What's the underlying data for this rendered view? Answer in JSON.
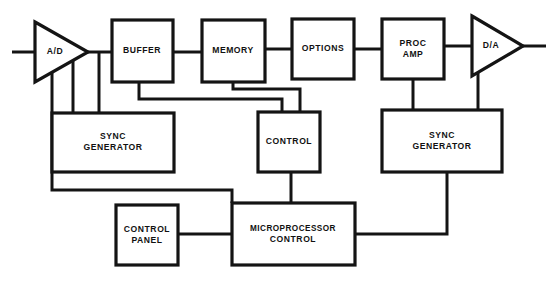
{
  "diagram": {
    "type": "block-diagram",
    "canvas": {
      "width": 556,
      "height": 282
    },
    "colors": {
      "background": "#ffffff",
      "stroke": "#141414",
      "text": "#111111"
    },
    "blocks": [
      {
        "id": "ad",
        "shape": "triangle",
        "label": "A/D",
        "lines": [
          "A/D"
        ],
        "x": 35,
        "y": 22,
        "width": 53,
        "height": 60,
        "label_x": 55,
        "label_y": 52
      },
      {
        "id": "buffer",
        "shape": "rect",
        "label": "BUFFER",
        "lines": [
          "BUFFER"
        ],
        "x": 112,
        "y": 20,
        "width": 61,
        "height": 62,
        "label_x": 142,
        "label_y": 51
      },
      {
        "id": "memory",
        "shape": "rect",
        "label": "MEMORY",
        "lines": [
          "MEMORY"
        ],
        "x": 202,
        "y": 20,
        "width": 63,
        "height": 62,
        "label_x": 233,
        "label_y": 51
      },
      {
        "id": "options",
        "shape": "rect",
        "label": "OPTIONS",
        "lines": [
          "OPTIONS"
        ],
        "x": 292,
        "y": 19,
        "width": 62,
        "height": 60,
        "label_x": 323,
        "label_y": 49
      },
      {
        "id": "proc-amp",
        "shape": "rect",
        "label": "PROC AMP",
        "lines": [
          "PROC",
          "AMP"
        ],
        "x": 382,
        "y": 19,
        "width": 62,
        "height": 60,
        "label_x": 413,
        "label_y": 49
      },
      {
        "id": "da",
        "shape": "triangle",
        "label": "D/A",
        "lines": [
          "D/A"
        ],
        "x": 472,
        "y": 16,
        "width": 51,
        "height": 60,
        "label_x": 491,
        "label_y": 46
      },
      {
        "id": "sync-generator-left",
        "shape": "rect",
        "label": "SYNC GENERATOR",
        "lines": [
          "SYNC",
          "GENERATOR"
        ],
        "x": 52,
        "y": 113,
        "width": 122,
        "height": 59,
        "label_x": 113,
        "label_y": 142
      },
      {
        "id": "control",
        "shape": "rect",
        "label": "CONTROL",
        "lines": [
          "CONTROL"
        ],
        "x": 258,
        "y": 112,
        "width": 62,
        "height": 60,
        "label_x": 289,
        "label_y": 142
      },
      {
        "id": "sync-generator-right",
        "shape": "rect",
        "label": "SYNC GENERATOR",
        "lines": [
          "SYNC",
          "GENERATOR"
        ],
        "x": 382,
        "y": 110,
        "width": 120,
        "height": 62,
        "label_x": 442,
        "label_y": 141
      },
      {
        "id": "control-panel",
        "shape": "rect",
        "label": "CONTROL PANEL",
        "lines": [
          "CONTROL",
          "PANEL"
        ],
        "x": 116,
        "y": 205,
        "width": 62,
        "height": 60,
        "label_x": 147,
        "label_y": 235
      },
      {
        "id": "microprocessor-control",
        "shape": "rect",
        "label": "MICROPROCESSOR CONTROL",
        "lines": [
          "MICROPROCESSOR",
          "CONTROL"
        ],
        "x": 232,
        "y": 203,
        "width": 123,
        "height": 62,
        "label_x": 293,
        "label_y": 234
      }
    ],
    "connections": [
      {
        "id": "input-to-ad",
        "from": "signal-input",
        "to": "ad",
        "path": "M 12 52 L 35 52"
      },
      {
        "id": "ad-to-buffer",
        "from": "ad",
        "to": "buffer",
        "path": "M 88 52 L 112 52"
      },
      {
        "id": "buffer-to-memory",
        "from": "buffer",
        "to": "memory",
        "path": "M 173 52 L 202 52"
      },
      {
        "id": "memory-to-options",
        "from": "memory",
        "to": "options",
        "path": "M 265 49 L 292 49"
      },
      {
        "id": "options-to-proc-amp",
        "from": "options",
        "to": "proc-amp",
        "path": "M 354 49 L 382 49"
      },
      {
        "id": "proc-amp-to-da",
        "from": "proc-amp",
        "to": "da",
        "path": "M 444 46 L 472 46"
      },
      {
        "id": "da-to-output",
        "from": "da",
        "to": "signal-output",
        "path": "M 523 46 L 546 46"
      },
      {
        "id": "ad-tap-to-sync-left-a",
        "from": "ad",
        "to": "sync-generator-left",
        "path": "M 99 53 L 99 113"
      },
      {
        "id": "ad-tap-to-sync-left-b",
        "from": "ad",
        "to": "sync-generator-left",
        "path": "M 73 53 L 73 113"
      },
      {
        "id": "ad-bottom-to-return-bus",
        "from": "ad",
        "to": "microprocessor-control",
        "path": "M 52 66 L 52 190 L 232 190 L 232 203"
      },
      {
        "id": "buffer-to-control",
        "from": "buffer",
        "to": "control",
        "path": "M 139 82 L 139 99 L 282 99 L 282 112"
      },
      {
        "id": "memory-to-control",
        "from": "memory",
        "to": "control",
        "path": "M 233 82 L 233 89 L 300 89 L 300 112"
      },
      {
        "id": "proc-amp-to-sync-right",
        "from": "proc-amp",
        "to": "sync-generator-right",
        "path": "M 413 79 L 413 110"
      },
      {
        "id": "da-to-sync-right",
        "from": "da",
        "to": "sync-generator-right",
        "path": "M 478 62 L 478 110"
      },
      {
        "id": "control-to-microprocessor",
        "from": "control",
        "to": "microprocessor-control",
        "path": "M 291 172 L 291 203"
      },
      {
        "id": "sync-right-to-microprocessor",
        "from": "sync-generator-right",
        "to": "microprocessor-control",
        "path": "M 447 172 L 447 234 L 355 234"
      },
      {
        "id": "control-panel-to-microprocessor",
        "from": "control-panel",
        "to": "microprocessor-control",
        "path": "M 178 234 L 232 234"
      }
    ]
  }
}
